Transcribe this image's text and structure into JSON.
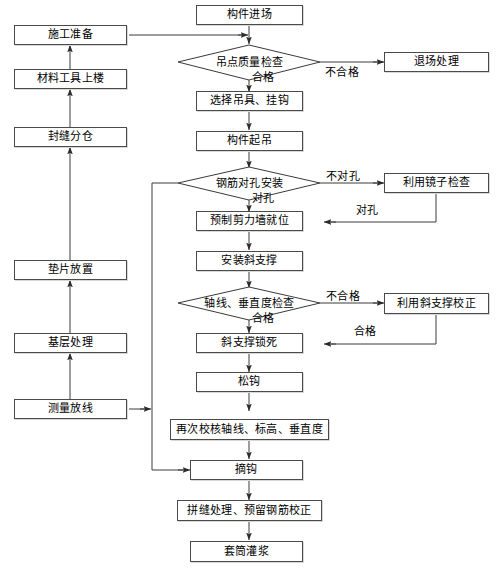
{
  "diagram": {
    "type": "flowchart",
    "canvas": {
      "width": 497,
      "height": 575
    },
    "colors": {
      "background": "#ffffff",
      "box_border": "#4a4a4a",
      "line": "#3a3a3a",
      "text": "#000000"
    }
  },
  "nodes": {
    "component_arrival": {
      "label": "构件进场",
      "shape": "rectangle",
      "column": "middle"
    },
    "lift_point_quality_check": {
      "label": "吊点质量检查",
      "shape": "diamond",
      "column": "middle"
    },
    "select_rigging_hook": {
      "label": "选择吊具、挂钩",
      "shape": "rectangle",
      "column": "middle"
    },
    "component_hoisting": {
      "label": "构件起吊",
      "shape": "rectangle",
      "column": "middle"
    },
    "rebar_hole_alignment": {
      "label": "钢筋对孔安装",
      "shape": "diamond",
      "column": "middle"
    },
    "shear_wall_in_place": {
      "label": "预制剪力墙就位",
      "shape": "rectangle",
      "column": "middle"
    },
    "install_diagonal_brace": {
      "label": "安装斜支撑",
      "shape": "rectangle",
      "column": "middle"
    },
    "axis_verticality_check": {
      "label": "轴线、垂直度检查",
      "shape": "diamond",
      "column": "middle"
    },
    "lock_diagonal_brace": {
      "label": "斜支撑锁死",
      "shape": "rectangle",
      "column": "middle"
    },
    "loosen_hook": {
      "label": "松钩",
      "shape": "rectangle",
      "column": "middle"
    },
    "recheck_axis_elevation": {
      "label": "再次校核轴线、标高、垂直度",
      "shape": "rectangle",
      "column": "middle"
    },
    "unhook": {
      "label": "摘钩",
      "shape": "rectangle",
      "column": "middle"
    },
    "joint_treatment_rebar": {
      "label": "拼缝处理、预留钢筋校正",
      "shape": "rectangle",
      "column": "middle"
    },
    "sleeve_grouting": {
      "label": "套筒灌浆",
      "shape": "rectangle",
      "column": "middle"
    },
    "construction_preparation": {
      "label": "施工准备",
      "shape": "rectangle",
      "column": "left"
    },
    "material_tools_upstairs": {
      "label": "材料工具上楼",
      "shape": "rectangle",
      "column": "left"
    },
    "seal_joint_compartment": {
      "label": "封缝分仓",
      "shape": "rectangle",
      "column": "left"
    },
    "shim_placement": {
      "label": "垫片放置",
      "shape": "rectangle",
      "column": "left"
    },
    "base_treatment": {
      "label": "基层处理",
      "shape": "rectangle",
      "column": "left"
    },
    "survey_setting_out": {
      "label": "测量放线",
      "shape": "rectangle",
      "column": "left"
    },
    "exit_site_handling": {
      "label": "退场处理",
      "shape": "rectangle",
      "column": "right"
    },
    "check_with_mirror": {
      "label": "利用镜子检查",
      "shape": "rectangle",
      "column": "right"
    },
    "correct_with_diagonal_brace": {
      "label": "利用斜支撑校正",
      "shape": "rectangle",
      "column": "right"
    }
  },
  "edge_labels": {
    "qualified_lift_point": "合格",
    "unqualified_lift_point": "不合格",
    "holes_not_aligned": "不对孔",
    "holes_aligned_down": "对孔",
    "holes_aligned_return": "对孔",
    "unqualified_axis": "不合格",
    "qualified_axis_down": "合格",
    "qualified_axis_return": "合格"
  },
  "edges": [
    {
      "from": "component_arrival",
      "to": "lift_point_quality_check",
      "label": ""
    },
    {
      "from": "construction_preparation",
      "to": "lift_point_quality_check",
      "label": ""
    },
    {
      "from": "lift_point_quality_check",
      "to": "select_rigging_hook",
      "label": "合格"
    },
    {
      "from": "lift_point_quality_check",
      "to": "exit_site_handling",
      "label": "不合格"
    },
    {
      "from": "select_rigging_hook",
      "to": "component_hoisting",
      "label": ""
    },
    {
      "from": "component_hoisting",
      "to": "rebar_hole_alignment",
      "label": ""
    },
    {
      "from": "rebar_hole_alignment",
      "to": "check_with_mirror",
      "label": "不对孔"
    },
    {
      "from": "rebar_hole_alignment",
      "to": "shear_wall_in_place",
      "label": "对孔"
    },
    {
      "from": "check_with_mirror",
      "to": "shear_wall_in_place",
      "label": "对孔"
    },
    {
      "from": "shear_wall_in_place",
      "to": "install_diagonal_brace",
      "label": ""
    },
    {
      "from": "install_diagonal_brace",
      "to": "axis_verticality_check",
      "label": ""
    },
    {
      "from": "axis_verticality_check",
      "to": "correct_with_diagonal_brace",
      "label": "不合格"
    },
    {
      "from": "axis_verticality_check",
      "to": "lock_diagonal_brace",
      "label": "合格"
    },
    {
      "from": "correct_with_diagonal_brace",
      "to": "lock_diagonal_brace",
      "label": "合格"
    },
    {
      "from": "lock_diagonal_brace",
      "to": "loosen_hook",
      "label": ""
    },
    {
      "from": "loosen_hook",
      "to": "recheck_axis_elevation",
      "label": ""
    },
    {
      "from": "recheck_axis_elevation",
      "to": "unhook",
      "label": ""
    },
    {
      "from": "unhook",
      "to": "joint_treatment_rebar",
      "label": ""
    },
    {
      "from": "joint_treatment_rebar",
      "to": "sleeve_grouting",
      "label": ""
    },
    {
      "from": "material_tools_upstairs",
      "to": "construction_preparation",
      "label": ""
    },
    {
      "from": "seal_joint_compartment",
      "to": "material_tools_upstairs",
      "label": ""
    },
    {
      "from": "shim_placement",
      "to": "seal_joint_compartment",
      "label": ""
    },
    {
      "from": "base_treatment",
      "to": "shim_placement",
      "label": ""
    },
    {
      "from": "survey_setting_out",
      "to": "base_treatment",
      "label": ""
    },
    {
      "from": "survey_setting_out",
      "to": "unhook",
      "label": ""
    }
  ]
}
